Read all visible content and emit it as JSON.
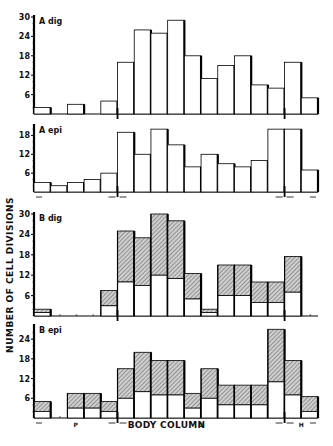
{
  "chart_data": [
    {
      "type": "bar",
      "panel": "A dig",
      "label": "A dig",
      "stacked": false,
      "bins": 17,
      "yticks": [
        6,
        12,
        18,
        24,
        30
      ],
      "ylim": [
        0,
        30
      ],
      "values": [
        2,
        0,
        3,
        0,
        4,
        16,
        26,
        25,
        29,
        18,
        11,
        15,
        18,
        9,
        8,
        16,
        5
      ],
      "boundary_markers": [
        5,
        15
      ]
    },
    {
      "type": "bar",
      "panel": "A epi",
      "label": "A epi",
      "stacked": false,
      "bins": 17,
      "yticks": [
        6,
        12,
        18
      ],
      "ylim": [
        0,
        21
      ],
      "values": [
        3,
        2,
        3,
        4,
        6,
        19,
        12,
        20,
        15,
        8,
        12,
        9,
        8,
        10,
        20,
        20,
        7
      ],
      "boundary_markers": [
        5,
        15
      ]
    },
    {
      "type": "bar",
      "panel": "B dig",
      "label": "B dig",
      "stacked": true,
      "bins": 17,
      "yticks": [
        6,
        12,
        18,
        24,
        30
      ],
      "ylim": [
        0,
        30
      ],
      "series": [
        {
          "name": "lower (open)",
          "values": [
            1,
            0,
            0,
            0,
            3,
            10,
            9,
            12,
            11,
            5,
            1,
            6,
            6,
            4,
            4,
            7,
            0
          ]
        },
        {
          "name": "upper (hatched)",
          "values": [
            1,
            0,
            0,
            0,
            4.5,
            15,
            14,
            18,
            17,
            7.5,
            1,
            9,
            9,
            6,
            6,
            10.5,
            0
          ]
        }
      ],
      "totals": [
        2,
        0,
        0,
        0,
        7.5,
        25,
        23,
        30,
        28,
        12.5,
        2,
        15,
        15,
        10,
        10,
        17.5,
        0
      ],
      "boundary_markers": [
        5,
        15
      ]
    },
    {
      "type": "bar",
      "panel": "B epi",
      "label": "B epi",
      "stacked": true,
      "bins": 17,
      "yticks": [
        6,
        12,
        18,
        24
      ],
      "ylim": [
        0,
        28
      ],
      "series": [
        {
          "name": "lower (open)",
          "values": [
            2,
            0,
            3,
            3,
            2,
            6,
            8,
            7,
            7,
            3,
            6,
            4,
            4,
            4,
            11,
            7,
            2
          ]
        },
        {
          "name": "upper (hatched)",
          "values": [
            3,
            0,
            4.5,
            4.5,
            3,
            9,
            12,
            10.5,
            10.5,
            4.5,
            9,
            6,
            6,
            6,
            16,
            10.5,
            4.5
          ]
        }
      ],
      "totals": [
        5,
        0,
        7.5,
        7.5,
        5,
        15,
        20,
        17.5,
        17.5,
        7.5,
        15,
        10,
        10,
        10,
        27,
        17.5,
        6.5
      ],
      "boundary_markers": [
        5,
        15
      ],
      "region_labels": [
        {
          "text": "P",
          "bin": 2.5
        },
        {
          "text": "G",
          "bin": 10
        },
        {
          "text": "H",
          "bin": 16
        }
      ]
    }
  ],
  "figure": {
    "ylabel": "NUMBER OF CELL DIVISIONS",
    "xlabel": "BODY COLUMN",
    "panels": [
      {
        "label": "A dig"
      },
      {
        "label": "A epi"
      },
      {
        "label": "B dig"
      },
      {
        "label": "B epi"
      }
    ],
    "region_labels": [
      "P",
      "G",
      "H"
    ]
  }
}
